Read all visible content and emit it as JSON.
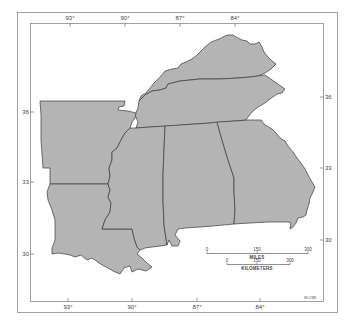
{
  "map": {
    "title": "",
    "colors": {
      "land_fill": "#b4b4b4",
      "state_border": "#3a3a3a",
      "frame": "#8a8a8a",
      "background": "#ffffff",
      "coastal_margin": "#ffffff"
    },
    "longitude_ticks_top": [
      "93°",
      "90°",
      "87°",
      "84°"
    ],
    "longitude_ticks_bottom": [
      "93°",
      "90°",
      "87°",
      "84°"
    ],
    "latitude_ticks_left": [
      "36",
      "33",
      "30"
    ],
    "latitude_ticks_right": [
      "36",
      "33",
      "30"
    ],
    "states_depicted": [
      "Kentucky",
      "Tennessee",
      "Arkansas",
      "Louisiana",
      "Mississippi",
      "Alabama",
      "Georgia"
    ],
    "scale_bar": {
      "miles": {
        "title": "MILES",
        "ticks": [
          "0",
          "150",
          "300"
        ]
      },
      "kilometers": {
        "title": "KILOMETERS",
        "ticks": [
          "0",
          "150",
          "300"
        ]
      }
    },
    "credit": "NLC/88"
  }
}
